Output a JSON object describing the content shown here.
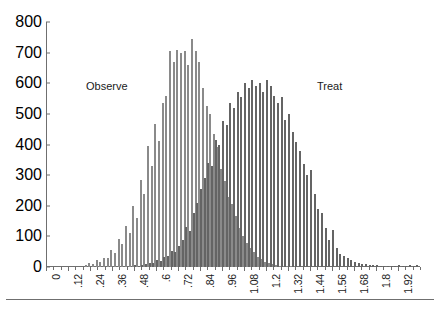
{
  "chart_data": {
    "type": "bar",
    "title": "",
    "subtitle": "",
    "xlabel": "",
    "ylabel": "",
    "ylim": [
      0,
      800
    ],
    "ytick_step": 100,
    "yticks": [
      0,
      100,
      200,
      300,
      400,
      500,
      600,
      700,
      800
    ],
    "xlim": [
      0,
      2.04
    ],
    "xtick_step": 0.12,
    "bin_width": 0.02,
    "grid": false,
    "legend_position": "inline-annotation",
    "xticks": [
      "0",
      ".12",
      ".24",
      ".36",
      ".48",
      ".6",
      ".72",
      ".84",
      ".96",
      "1.08",
      "1.2",
      "1.32",
      "1.44",
      "1.56",
      "1.68",
      "1.8",
      "1.92"
    ],
    "annotations": [
      {
        "text": "Observe",
        "x": 0.5,
        "y": 580
      },
      {
        "text": "Treat",
        "x": 1.62,
        "y": 580
      }
    ],
    "colors": {
      "observe_fill": "#d6d6d6",
      "observe_edge": "#8a8a8a",
      "treat_fill": "#7f7f7f",
      "treat_edge": "#646464",
      "axis": "#6f6f6f",
      "text": "#1a1a1a",
      "background": "#ffffff"
    },
    "x": [
      0.22,
      0.24,
      0.26,
      0.28,
      0.3,
      0.32,
      0.34,
      0.36,
      0.38,
      0.4,
      0.42,
      0.44,
      0.46,
      0.48,
      0.5,
      0.52,
      0.54,
      0.56,
      0.58,
      0.6,
      0.62,
      0.64,
      0.66,
      0.68,
      0.7,
      0.72,
      0.74,
      0.76,
      0.78,
      0.8,
      0.82,
      0.84,
      0.86,
      0.88,
      0.9,
      0.92,
      0.94,
      0.96,
      0.98,
      1.0,
      1.02,
      1.04,
      1.06,
      1.08,
      1.1,
      1.12,
      1.14,
      1.16,
      1.18,
      1.2,
      1.22,
      1.24,
      1.26,
      1.28,
      1.3,
      1.32,
      1.34,
      1.36,
      1.38,
      1.4,
      1.42,
      1.44,
      1.46,
      1.48,
      1.5,
      1.52,
      1.54,
      1.56,
      1.58,
      1.6,
      1.62,
      1.64,
      1.66,
      1.68,
      1.7,
      1.72,
      1.74,
      1.76,
      1.78,
      1.8,
      1.82,
      1.84,
      1.86,
      1.88,
      1.9,
      1.92,
      1.94,
      1.96,
      1.98,
      2.0,
      2.02
    ],
    "series": [
      {
        "name": "Observe",
        "fill": "#d6d6d6",
        "values": [
          8,
          14,
          10,
          22,
          18,
          30,
          28,
          56,
          46,
          92,
          75,
          135,
          110,
          200,
          160,
          285,
          238,
          395,
          330,
          468,
          412,
          537,
          560,
          705,
          668,
          710,
          700,
          705,
          660,
          745,
          706,
          668,
          585,
          525,
          500,
          435,
          392,
          320,
          280,
          228,
          205,
          168,
          128,
          102,
          78,
          62,
          48,
          34,
          25,
          18,
          12,
          9,
          6,
          4,
          3,
          2,
          1,
          1,
          0,
          0,
          0,
          0,
          0,
          0,
          0,
          0,
          0,
          0,
          0,
          0,
          0,
          0,
          0,
          0,
          0,
          0,
          0,
          0,
          0,
          0,
          0,
          0,
          0,
          0,
          0,
          0,
          0,
          0,
          0,
          0,
          0
        ]
      },
      {
        "name": "Treat",
        "fill": "#7f7f7f",
        "values": [
          0,
          0,
          0,
          0,
          0,
          0,
          0,
          0,
          0,
          0,
          0,
          0,
          0,
          5,
          4,
          8,
          10,
          14,
          12,
          22,
          20,
          32,
          36,
          52,
          48,
          70,
          88,
          130,
          118,
          175,
          210,
          255,
          290,
          340,
          330,
          415,
          400,
          478,
          465,
          535,
          520,
          570,
          555,
          600,
          585,
          612,
          590,
          600,
          572,
          610,
          592,
          560,
          535,
          555,
          480,
          500,
          440,
          408,
          380,
          335,
          300,
          318,
          240,
          188,
          175,
          128,
          88,
          120,
          62,
          44,
          36,
          28,
          22,
          18,
          14,
          11,
          9,
          7,
          6,
          5,
          4,
          3,
          3,
          2,
          2,
          5,
          4,
          2,
          6,
          3,
          7
        ]
      }
    ]
  },
  "chart": {
    "observe_label": "Observe",
    "treat_label": "Treat"
  }
}
